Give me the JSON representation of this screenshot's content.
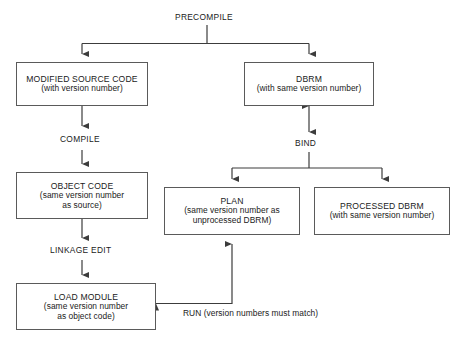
{
  "diagram": {
    "title": "PRECOMPILE",
    "nodes": [
      {
        "id": "modified-source-code",
        "title": "MODIFIED SOURCE CODE",
        "sub": [
          "(with version number)"
        ]
      },
      {
        "id": "dbrm",
        "title": "DBRM",
        "sub": [
          "(with same version number)"
        ]
      },
      {
        "id": "object-code",
        "title": "OBJECT CODE",
        "sub": [
          "(same version number",
          "as source)"
        ]
      },
      {
        "id": "plan",
        "title": "PLAN",
        "sub": [
          "(same version number as",
          "unprocessed DBRM)"
        ]
      },
      {
        "id": "processed-dbrm",
        "title": "PROCESSED DBRM",
        "sub": [
          "(with same version number)"
        ]
      },
      {
        "id": "load-module",
        "title": "LOAD MODULE",
        "sub": [
          "(same version number",
          "as object code)"
        ]
      }
    ],
    "edge_labels": {
      "precompile": "PRECOMPILE",
      "compile": "COMPILE",
      "bind": "BIND",
      "linkage_edit": "LINKAGE EDIT",
      "run": "RUN (version numbers must match)"
    },
    "colors": {
      "stroke": "#5a5a5a",
      "wire": "#3c3c3c",
      "text": "#1a1a1a",
      "background": "#ffffff"
    }
  }
}
